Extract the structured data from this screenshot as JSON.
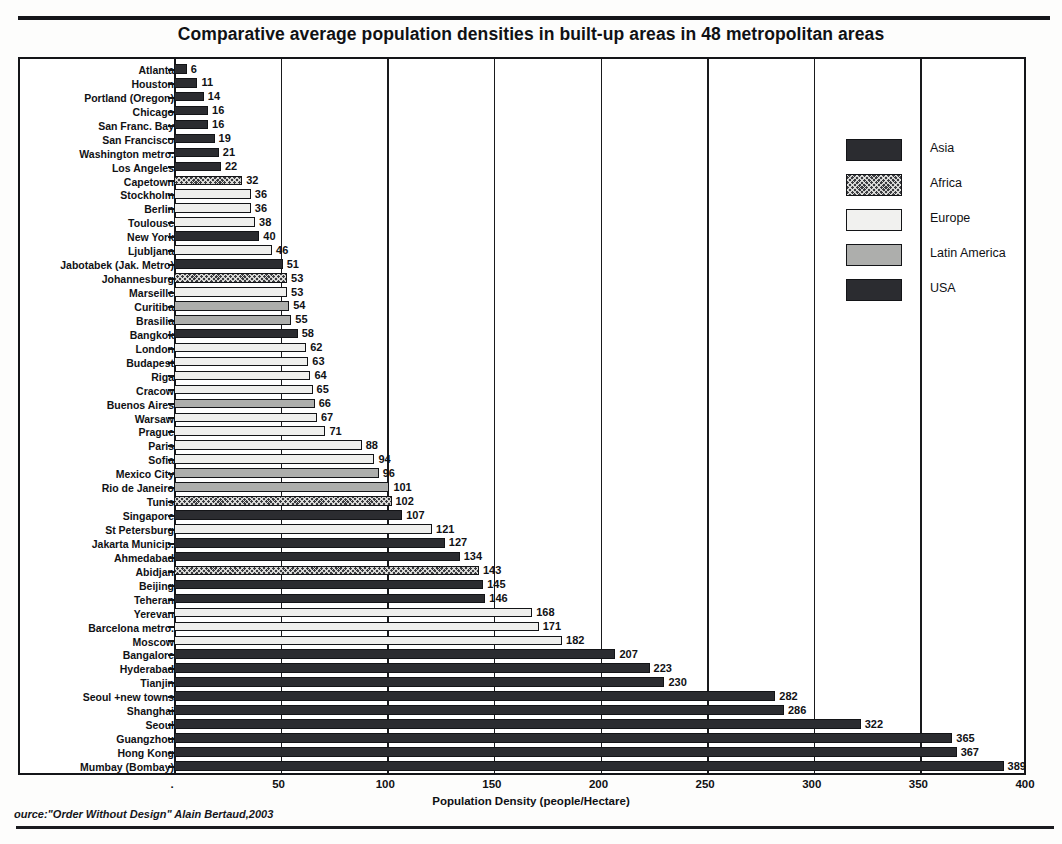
{
  "chart_data": {
    "type": "bar",
    "orientation": "horizontal",
    "title": "Comparative  average population densities in built-up areas in 48 metropolitan areas",
    "xlabel": "Population Density (people/Hectare)",
    "ylabel": "",
    "xlim": [
      0,
      400
    ],
    "xticks": [
      ".",
      "50",
      "100",
      "150",
      "200",
      "250",
      "300",
      "350",
      "400"
    ],
    "xtick_values": [
      0,
      50,
      100,
      150,
      200,
      250,
      300,
      350,
      400
    ],
    "grid": true,
    "legend_position": "upper-right-inside",
    "source": "ource:\"Order Without Design\" Alain Bertaud,2003",
    "legend": [
      {
        "label": "Asia",
        "key": "asia",
        "color": "#2b2c30"
      },
      {
        "label": "Africa",
        "key": "africa",
        "color": "#3a3b3f"
      },
      {
        "label": "Europe",
        "key": "europe",
        "color": "#efefed"
      },
      {
        "label": "Latin America",
        "key": "latin",
        "color": "#adaeac"
      },
      {
        "label": "USA",
        "key": "usa",
        "color": "#2b2c30"
      }
    ],
    "categories": [
      "Atlanta",
      "Houston",
      "Portland (Oregon)",
      "Chicago",
      "San Franc. Bay",
      "San Francisco",
      "Washington metro.",
      "Los Angeles",
      "Capetown",
      "Stockholm",
      "Berlin",
      "Toulouse",
      "New York",
      "Ljubljana",
      "Jabotabek (Jak. Metro)",
      "Johannesburg",
      "Marseille",
      "Curitiba",
      "Brasilia",
      "Bangkok",
      "London",
      "Budapest",
      "Riga",
      "Cracow",
      "Buenos Aires",
      "Warsaw",
      "Prague",
      "Paris",
      "Sofia",
      "Mexico City",
      "Rio de Janeiro",
      "Tunis",
      "Singapore",
      "St Petersburg",
      "Jakarta Municip.",
      "Ahmedabad",
      "Abidjan",
      "Beijing",
      "Teheran",
      "Yerevan",
      "Barcelona metro.",
      "Moscow",
      "Bangalore",
      "Hyderabad",
      "Tianjin",
      "Seoul +new towns",
      "Shanghai",
      "Seoul",
      "Guangzhou",
      "Hong Kong",
      "Mumbay (Bombay)"
    ],
    "values": [
      6,
      11,
      14,
      16,
      16,
      19,
      21,
      22,
      32,
      36,
      36,
      38,
      40,
      46,
      51,
      53,
      53,
      54,
      55,
      58,
      62,
      63,
      64,
      65,
      66,
      67,
      71,
      88,
      94,
      96,
      101,
      102,
      107,
      121,
      127,
      134,
      143,
      145,
      146,
      168,
      171,
      182,
      207,
      223,
      230,
      282,
      286,
      322,
      365,
      367,
      389
    ],
    "groups": [
      "usa",
      "usa",
      "usa",
      "usa",
      "usa",
      "usa",
      "usa",
      "usa",
      "africa",
      "europe",
      "europe",
      "europe",
      "usa",
      "europe",
      "asia",
      "africa",
      "europe",
      "latin",
      "latin",
      "asia",
      "europe",
      "europe",
      "europe",
      "europe",
      "latin",
      "europe",
      "europe",
      "europe",
      "europe",
      "latin",
      "latin",
      "africa",
      "asia",
      "europe",
      "asia",
      "asia",
      "africa",
      "asia",
      "asia",
      "europe",
      "europe",
      "europe",
      "asia",
      "asia",
      "asia",
      "asia",
      "asia",
      "asia",
      "asia",
      "asia",
      "asia"
    ]
  }
}
